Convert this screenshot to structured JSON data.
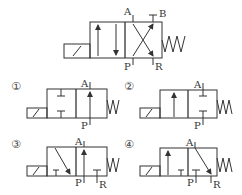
{
  "diagram": {
    "stroke_color": "#333333",
    "main_valve": {
      "ports_top": [
        "A",
        "B"
      ],
      "ports_bottom": [
        "P",
        "R"
      ]
    },
    "options": [
      {
        "number": "①",
        "ports": {
          "top": "A",
          "bottom": "P"
        }
      },
      {
        "number": "②",
        "ports": {
          "top": "A",
          "bottom": "P"
        }
      },
      {
        "number": "③",
        "ports": {
          "top": "A",
          "bottom_p": "P",
          "bottom_r": "R"
        }
      },
      {
        "number": "④",
        "ports": {
          "top": "A",
          "bottom_p": "P",
          "bottom_r": "R"
        }
      }
    ]
  }
}
